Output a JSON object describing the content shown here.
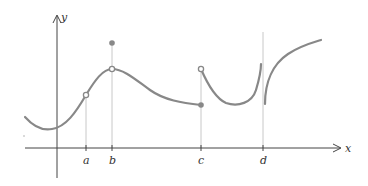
{
  "diagram": {
    "type": "function-graph",
    "axes": {
      "x_label": "x",
      "y_label": "y"
    },
    "ticks": [
      {
        "label": "a"
      },
      {
        "label": "b"
      },
      {
        "label": "c"
      },
      {
        "label": "d"
      }
    ],
    "colors": {
      "curve": "#888888",
      "axis": "#444444",
      "guide": "#c8c8c8",
      "point": "#888888"
    },
    "features": {
      "a": "continuous point marked with open circle on curve",
      "b": "removable discontinuity: open circle on curve, filled dot above",
      "c": "jump discontinuity: filled dot on left branch, open circle on right branch above",
      "d": "infinite discontinuity: vertical asymptote"
    }
  }
}
